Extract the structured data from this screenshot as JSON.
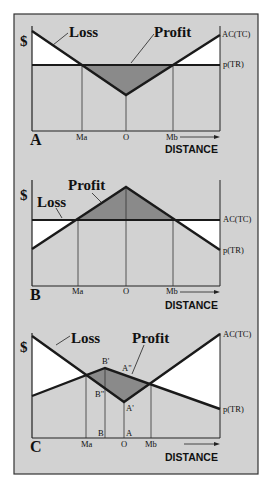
{
  "figure": {
    "background_color": "#d2d2d2",
    "profit_fill": "#8a8a8a",
    "loss_fill": "#ffffff",
    "line_color": "#1a1a1a"
  },
  "axis": {
    "y_label": "$",
    "x_label": "DISTANCE"
  },
  "panels": [
    {
      "letter": "A",
      "loss_label": "Loss",
      "profit_label": "Profit",
      "curve_top_label": "AC(TC)",
      "curve_bottom_label": "p(TR)",
      "ticks": [
        "Ma",
        "O",
        "Mb"
      ]
    },
    {
      "letter": "B",
      "loss_label": "Loss",
      "profit_label": "Profit",
      "curve_top_label": "AC(TC)",
      "curve_bottom_label": "p(TR)",
      "ticks": [
        "Ma",
        "O",
        "Mb"
      ]
    },
    {
      "letter": "C",
      "loss_label": "Loss",
      "profit_label": "Profit",
      "curve_top_label": "AC(TC)",
      "curve_bottom_label": "p(TR)",
      "ticks": [
        "Ma",
        "O",
        "Mb"
      ],
      "point_labels": {
        "b_prime": "B'",
        "a_double_prime": "A\"",
        "b_double_prime": "B\"",
        "a_prime": "A'",
        "b_base": "B",
        "a_base": "A"
      }
    }
  ]
}
